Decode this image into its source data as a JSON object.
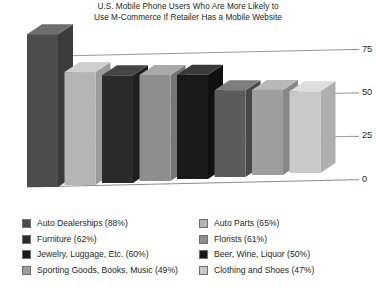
{
  "chart_data": {
    "type": "bar",
    "title": "U.S. Mobile Phone Users Who Are More Likely to Use M-Commerce If Retailer Has a Mobile Website",
    "title_line1": "U.S. Mobile Phone Users Who Are More Likely to",
    "title_line2": "Use M-Commerce If Retailer Has a Mobile Website",
    "xlabel": "",
    "ylabel": "",
    "ylim": [
      0,
      87.5
    ],
    "grid": true,
    "legend_position": "bottom",
    "style": "3d-vertical-bars",
    "categories": [
      "Auto Dealerships",
      "Auto Parts",
      "Furniture",
      "Florists",
      "Jewelry, Luggage, Etc.",
      "Beer, Wine, Liquor",
      "Sporting Goods, Books, Music",
      "Clothing and Shoes"
    ],
    "values": [
      88,
      65,
      62,
      61,
      60,
      50,
      49,
      47
    ],
    "yticks": [
      0,
      25,
      50,
      75
    ],
    "ytick_labels": [
      "0",
      "25",
      "50",
      "75"
    ],
    "bar_colors": [
      "#4d4d4d",
      "#b5b5b5",
      "#2b2b2b",
      "#8e8e8e",
      "#1a1a1a",
      "#5c5c5c",
      "#9e9e9e",
      "#c9c9c9"
    ],
    "bar_top_colors": [
      "#6e6e6e",
      "#cfcfcf",
      "#454545",
      "#a9a9a9",
      "#3a3a3a",
      "#7d7d7d",
      "#b8b8b8",
      "#dedede"
    ],
    "bar_side_colors": [
      "#3b3b3b",
      "#9c9c9c",
      "#1f1f1f",
      "#757575",
      "#101010",
      "#484848",
      "#878787",
      "#afafaf"
    ]
  },
  "axis": {
    "ticks": [
      {
        "label": "75"
      },
      {
        "label": "50"
      },
      {
        "label": "25"
      },
      {
        "label": "0"
      }
    ]
  },
  "legend": {
    "left_column": [
      {
        "label": "Auto Dealerships (88%)",
        "color": "#4d4d4d"
      },
      {
        "label": "Furniture (62%)",
        "color": "#2b2b2b"
      },
      {
        "label": "Jewelry, Luggage, Etc. (60%)",
        "color": "#1a1a1a"
      },
      {
        "label": "Sporting Goods, Books, Music (49%)",
        "color": "#9e9e9e"
      }
    ],
    "right_column": [
      {
        "label": "Auto Parts (65%)",
        "color": "#b5b5b5"
      },
      {
        "label": "Florists (61%)",
        "color": "#8e8e8e"
      },
      {
        "label": "Beer, Wine, Liquor (50%)",
        "color": "#1a1a1a"
      },
      {
        "label": "Clothing and Shoes (47%)",
        "color": "#c9c9c9"
      }
    ]
  },
  "colors": {
    "background": "#ffffff",
    "text": "#231f20",
    "gridline": "#7d7d7d"
  }
}
